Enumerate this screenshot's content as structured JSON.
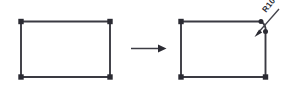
{
  "figure": {
    "background_color": "#ffffff",
    "line_color": "#3a3a42",
    "marker_color": "#2b2b33",
    "width": 281,
    "height": 92
  },
  "before": {
    "label": "Sharp-corner rectangle",
    "shape_type": "rectangle",
    "corner_count": "4",
    "vertex_marker_shape": "square"
  },
  "after": {
    "label": "Rectangle with filleted top-right corner",
    "shape_type": "rectangle-with-fillet",
    "filleted_corner": "top-right",
    "vertex_marker_shape": "square"
  },
  "callout": {
    "text": "R10",
    "kind": "radius-dimension",
    "leader_style": "arrow",
    "rotation_degrees": "-52"
  },
  "transform": {
    "arrow_label": "becomes",
    "direction": "right"
  }
}
